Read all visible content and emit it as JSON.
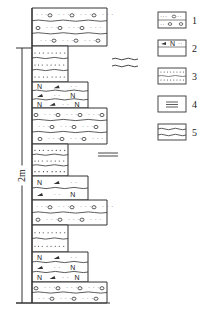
{
  "diagram": {
    "type": "stratigraphic-column",
    "scale_bar": {
      "label": "2m",
      "top_y": 48,
      "bottom_y": 303
    },
    "column_left_x": 32,
    "lithologies": {
      "1": {
        "name": "conglomerate",
        "right_x": 107
      },
      "2": {
        "name": "arkose",
        "right_x": 88
      },
      "3": {
        "name": "sandstone",
        "right_x": 68
      }
    },
    "units": [
      {
        "lith": "1",
        "top": 8,
        "bottom": 46,
        "beds": 3
      },
      {
        "lith": "3",
        "top": 46,
        "bottom": 82,
        "beds": 3
      },
      {
        "lith": "2",
        "top": 82,
        "bottom": 108,
        "beds": 3
      },
      {
        "lith": "1",
        "top": 108,
        "bottom": 144,
        "beds": 3
      },
      {
        "lith": "3",
        "top": 144,
        "bottom": 176,
        "beds": 3
      },
      {
        "lith": "2",
        "top": 176,
        "bottom": 200,
        "beds": 2
      },
      {
        "lith": "1",
        "top": 200,
        "bottom": 225,
        "beds": 2
      },
      {
        "lith": "3",
        "top": 225,
        "bottom": 252,
        "beds": 2
      },
      {
        "lith": "2",
        "top": 252,
        "bottom": 282,
        "beds": 3
      },
      {
        "lith": "1",
        "top": 282,
        "bottom": 303,
        "beds": 2
      }
    ],
    "annotations": [
      {
        "symbol": "wavy-bedding",
        "legend_ref": "5",
        "x": 112,
        "y": 62
      },
      {
        "symbol": "horizontal-bedding",
        "legend_ref": "4",
        "x": 112,
        "y": 155
      }
    ],
    "legend": {
      "items": [
        {
          "num": "1",
          "symbol": "conglomerate"
        },
        {
          "num": "2",
          "symbol": "arkose"
        },
        {
          "num": "3",
          "symbol": "sandstone"
        },
        {
          "num": "4",
          "symbol": "horizontal-bedding"
        },
        {
          "num": "5",
          "symbol": "wavy-bedding"
        }
      ]
    },
    "colors": {
      "line": "#333333",
      "background": "#ffffff"
    }
  }
}
